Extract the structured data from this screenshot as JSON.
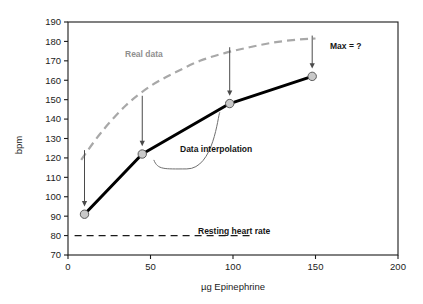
{
  "chart_data": {
    "type": "line",
    "title": "",
    "subtitle": "",
    "xlabel": "µg Epinephrine",
    "ylabel": "bpm",
    "xlim": [
      0,
      200
    ],
    "ylim": [
      70,
      190
    ],
    "grid": false,
    "legend_position": "none",
    "x_ticks": [
      0,
      50,
      100,
      150,
      200
    ],
    "x_tick_labels": [
      "0",
      "50",
      "100",
      "150",
      "200"
    ],
    "y_ticks": [
      70,
      80,
      90,
      100,
      110,
      120,
      130,
      140,
      150,
      160,
      170,
      180,
      190
    ],
    "y_tick_labels": [
      "70",
      "80",
      "90",
      "100",
      "110",
      "120",
      "130",
      "140",
      "150",
      "160",
      "170",
      "180",
      "190"
    ],
    "series": [
      {
        "name": "Measured data points",
        "style": "solid-line-with-markers",
        "color": "#000000",
        "marker_fill": "#c9c9c9",
        "x": [
          10,
          45,
          98,
          148
        ],
        "y": [
          91,
          122,
          148,
          162
        ]
      },
      {
        "name": "Real data",
        "style": "dashed-curve",
        "color": "#a8a8a8",
        "x": [
          8,
          20,
          35,
          50,
          65,
          80,
          95,
          110,
          125,
          140,
          150
        ],
        "y": [
          119,
          133,
          147,
          157,
          164,
          170,
          174,
          177,
          179.5,
          181,
          181.5
        ]
      },
      {
        "name": "Resting heart rate",
        "style": "dashed-horizontal",
        "color": "#1a1a1a",
        "y_value": 80,
        "x_start": 4,
        "x_end": 110
      }
    ],
    "annotations": [
      {
        "name": "real-data-label",
        "text": "Real data",
        "x": 30,
        "y": 168,
        "color": "#8f8f8f",
        "bold": true
      },
      {
        "name": "data-interpolation-label",
        "text": "Data interpolation",
        "x": 76,
        "y": 123,
        "color": "#151515",
        "bold": true
      },
      {
        "name": "max-question-label",
        "text": "Max = ?",
        "x": 163,
        "y": 176,
        "color": "#151515",
        "bold": true
      },
      {
        "name": "resting-heart-rate-label",
        "text": "Resting heart rate",
        "x": 117,
        "y": 80,
        "color": "#151515",
        "bold": true
      }
    ],
    "arrows": [
      {
        "name": "arrow-to-point-1",
        "x": 10,
        "y_from": 124,
        "y_to": 95
      },
      {
        "name": "arrow-to-point-2",
        "x": 45,
        "y_from": 152,
        "y_to": 126
      },
      {
        "name": "arrow-to-point-3",
        "x": 98,
        "y_from": 177,
        "y_to": 152
      },
      {
        "name": "arrow-to-point-4",
        "x": 148,
        "y_from": 183,
        "y_to": 166
      }
    ],
    "brace": {
      "name": "interpolation-brace",
      "from_x": 52,
      "from_y": 120,
      "to_x": 92,
      "to_y": 144
    }
  },
  "axes": {
    "y": {
      "title": "bpm"
    },
    "x": {
      "title": "µg Epinephrine"
    }
  },
  "labels": {
    "real_data": "Real data",
    "data_interpolation": "Data interpolation",
    "max_question": "Max = ?",
    "resting_heart_rate": "Resting heart rate"
  },
  "colors": {
    "axis": "#1a1a1a",
    "measured_line": "#000000",
    "marker_fill": "#c9c9c9",
    "real_data_curve": "#a8a8a8",
    "resting_line": "#1a1a1a",
    "arrow": "#4a4a4a",
    "background": "#ffffff"
  }
}
